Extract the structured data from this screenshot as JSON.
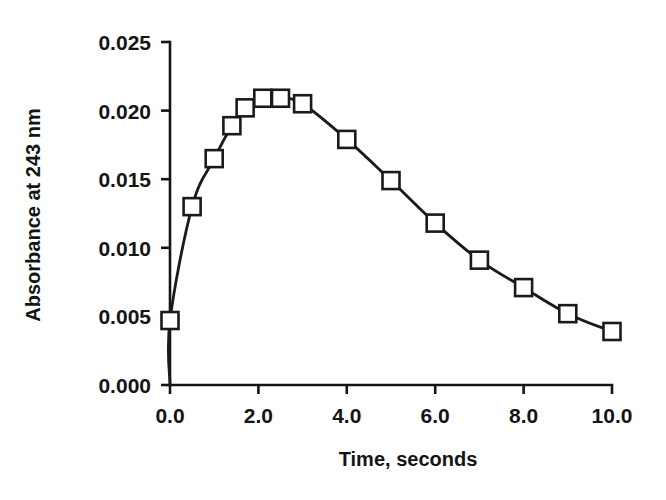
{
  "chart_data": {
    "type": "line",
    "title": "",
    "xlabel": "Time, seconds",
    "ylabel": "Absorbance at 243 nm",
    "xlim": [
      0.0,
      10.0
    ],
    "ylim": [
      0.0,
      0.025
    ],
    "grid": false,
    "legend": "none",
    "marker": "open-square",
    "xticks": [
      0.0,
      2.0,
      4.0,
      6.0,
      8.0,
      10.0
    ],
    "xtick_labels": [
      "0.0",
      "2.0",
      "4.0",
      "6.0",
      "8.0",
      "10.0"
    ],
    "yticks": [
      0.0,
      0.005,
      0.01,
      0.015,
      0.02,
      0.025
    ],
    "ytick_labels": [
      "0.000",
      "0.005",
      "0.010",
      "0.015",
      "0.020",
      "0.025"
    ],
    "x": [
      0.0,
      0.5,
      1.0,
      1.4,
      1.7,
      2.1,
      2.5,
      3.0,
      4.0,
      5.0,
      6.0,
      7.0,
      8.0,
      9.0,
      10.0
    ],
    "values": [
      0.0047,
      0.013,
      0.0165,
      0.0189,
      0.0202,
      0.0209,
      0.0209,
      0.0205,
      0.0179,
      0.0149,
      0.0118,
      0.0091,
      0.0071,
      0.0052,
      0.0039
    ],
    "origin_anchor": {
      "x": 0.0,
      "y": 0.0
    },
    "series_color": "#1a1a1a"
  },
  "colors": {
    "ink": "#141414",
    "line": "#1a1a1a",
    "marker_fill": "#ffffff",
    "background": "#ffffff"
  }
}
